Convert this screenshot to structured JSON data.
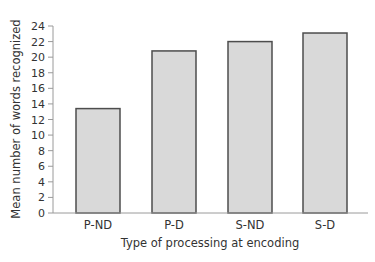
{
  "chart_data": {
    "type": "bar",
    "title": "",
    "xlabel": "Type of processing at encoding",
    "ylabel": "Mean number of words recognized",
    "categories": [
      "P-ND",
      "P-D",
      "S-ND",
      "S-D"
    ],
    "values": [
      13.4,
      20.8,
      22.0,
      23.1
    ],
    "ylim": [
      0,
      24
    ],
    "yticks": [
      0,
      2,
      4,
      6,
      8,
      10,
      12,
      14,
      16,
      18,
      20,
      22,
      24
    ],
    "grid": false,
    "legend": null,
    "colors": {
      "bar_fill": "#d9d9d9",
      "bar_stroke": "#4d4d4d",
      "axis": "#9a9a9a"
    }
  }
}
